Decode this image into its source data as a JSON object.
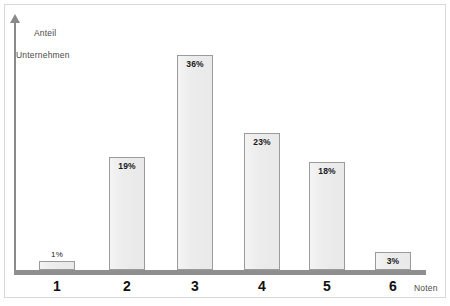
{
  "chart_data": {
    "type": "bar",
    "title": "",
    "xlabel": "Noten",
    "ylabel": "Anteil Unternehmen",
    "ylabel_line1": "Anteil",
    "ylabel_line2": "Unternehmen",
    "categories": [
      "1",
      "2",
      "3",
      "4",
      "5",
      "6"
    ],
    "values": [
      1,
      19,
      36,
      23,
      18,
      3
    ],
    "value_labels": [
      "1%",
      "19%",
      "36%",
      "23%",
      "18%",
      "3%"
    ],
    "ylim": [
      0,
      40
    ],
    "grid": false,
    "legend": null,
    "bar_fill_color": "#eeeeee",
    "bar_border_color": "#9b9b9b",
    "axis_color": "#8f8f8f",
    "label_color": "#4a4a4a",
    "tick_color": "#111111"
  },
  "axes": {
    "y_caption_line1": "Anteil",
    "y_caption_line2": "Unternehmen",
    "x_caption": "Noten"
  }
}
